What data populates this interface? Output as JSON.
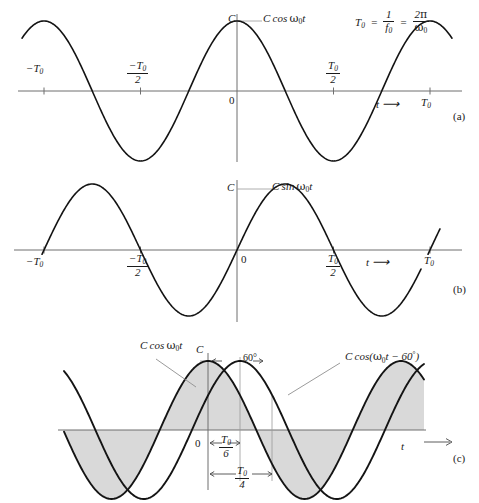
{
  "figure": {
    "panels": [
      {
        "tag": "(a)",
        "signal_label_parts": {
          "amp": "C",
          "func": "cos",
          "omega": "ω",
          "omega_sub": "0",
          "var": "t"
        },
        "signal_label": "C cos ω0t",
        "amplitude_label": "C",
        "origin_label": "0",
        "axis_label": "t",
        "arrow": "→",
        "period_formula": {
          "lhs": "T0",
          "mid": "1/f0",
          "rhs": "2π/ω0"
        },
        "ticks": [
          {
            "label": "-T0",
            "value": -1.0
          },
          {
            "label": "-T0/2",
            "value": -0.5
          },
          {
            "label": "T0/2",
            "value": 0.5
          },
          {
            "label": "T0",
            "value": 1.0
          }
        ]
      },
      {
        "tag": "(b)",
        "signal_label": "C sin ω0t",
        "amplitude_label": "C",
        "origin_label": "0",
        "axis_label": "t",
        "arrow": "→",
        "ticks": [
          {
            "label": "-T0",
            "value": -1.0
          },
          {
            "label": "-T0/2",
            "value": -0.5
          },
          {
            "label": "T0/2",
            "value": 0.5
          },
          {
            "label": "T0",
            "value": 1.0
          }
        ]
      },
      {
        "tag": "(c)",
        "signal_label_a": "C cos ω0t",
        "signal_label_b": "C cos(ω0t − 60°)",
        "amplitude_label": "C",
        "origin_label": "0",
        "axis_label": "t",
        "arrow": "→",
        "phase_label": "60°",
        "dim_labels": [
          {
            "num": "T0",
            "den": "6"
          },
          {
            "num": "T0",
            "den": "4"
          }
        ]
      }
    ]
  },
  "chart_data": [
    {
      "type": "line",
      "title": "C cos ω0t",
      "xlabel": "t",
      "ylabel": "",
      "xlim": [
        -1.35,
        1.35
      ],
      "ylim": [
        -1.25,
        1.25
      ],
      "grid": false,
      "legend": "none",
      "annotations": [
        "C",
        "0",
        "T0 = 1/f0 = 2π/ω0",
        "t →"
      ],
      "xtick_labels": [
        "-T0",
        "-T0/2",
        "T0/2",
        "T0"
      ],
      "xticks": [
        -1.0,
        -0.5,
        0.5,
        1.0
      ],
      "series": [
        {
          "name": "C cos ω0t",
          "formula": "cos(2*pi*x)",
          "amplitude": 1.0,
          "phase_deg": 0
        }
      ]
    },
    {
      "type": "line",
      "title": "C sin ω0t",
      "xlabel": "t",
      "ylabel": "",
      "xlim": [
        -1.35,
        1.35
      ],
      "ylim": [
        -1.25,
        1.25
      ],
      "grid": false,
      "legend": "none",
      "annotations": [
        "C",
        "0",
        "t →"
      ],
      "xtick_labels": [
        "-T0",
        "-T0/2",
        "T0/2",
        "T0"
      ],
      "xticks": [
        -1.0,
        -0.5,
        0.5,
        1.0
      ],
      "series": [
        {
          "name": "C sin ω0t",
          "formula": "sin(2*pi*x)",
          "amplitude": 1.0,
          "phase_deg": -90
        }
      ]
    },
    {
      "type": "line",
      "title": "C cos ω0t and C cos(ω0t − 60°)",
      "xlabel": "t",
      "ylabel": "",
      "xlim": [
        -1.1,
        1.25
      ],
      "ylim": [
        -1.25,
        1.25
      ],
      "grid": false,
      "legend": "inline-labels",
      "annotations": [
        "C",
        "0",
        "60°",
        "T0/6",
        "T0/4",
        "t →"
      ],
      "shaded_region": "area under C cos ω0t",
      "series": [
        {
          "name": "C cos ω0t",
          "formula": "cos(2*pi*x)",
          "amplitude": 1.0,
          "phase_deg": 0
        },
        {
          "name": "C cos(ω0t − 60°)",
          "formula": "cos(2*pi*x - pi/3)",
          "amplitude": 1.0,
          "phase_deg": -60
        }
      ]
    }
  ]
}
